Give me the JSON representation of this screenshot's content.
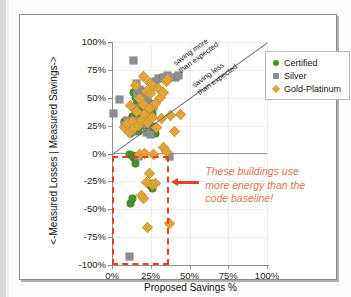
{
  "chart_data": {
    "type": "scatter",
    "title": "",
    "xlabel": "Proposed Savings %",
    "ylabel": "<-Measured Losses | Measured Savings->",
    "xlim": [
      0,
      100
    ],
    "ylim": [
      -100,
      100
    ],
    "xticks": [
      "0%",
      "25%",
      "50%",
      "75%",
      "100%"
    ],
    "xtick_values": [
      0,
      25,
      50,
      75,
      100
    ],
    "yticks": [
      "100%",
      "75%",
      "50%",
      "25%",
      "0%",
      "-25%",
      "-50%",
      "-75%",
      "-100%"
    ],
    "ytick_values": [
      100,
      75,
      50,
      25,
      0,
      -25,
      -50,
      -75,
      -100
    ],
    "grid": true,
    "legend_position": "top-right",
    "legend": [
      "Certified",
      "Silver",
      "Gold-Platinum"
    ],
    "colors": {
      "certified": "#4a9028",
      "silver": "#8a8f91",
      "gold": "#e0a53a",
      "highlight": "#e8401f",
      "annotation": "#e2724a",
      "parity_line": "#6b6b6b"
    },
    "reference_line": {
      "label_above": "saving more than expected",
      "label_below": "saving less than expected",
      "from": [
        0,
        0
      ],
      "to": [
        100,
        100
      ]
    },
    "annotations": [
      {
        "text": "These buildings use more energy than the code baseline!",
        "lines": [
          "These buildings use",
          "more energy than the",
          "code baseline!"
        ],
        "color": "#e2724a"
      }
    ],
    "highlight_region": {
      "x_range": [
        0,
        37
      ],
      "y_range": [
        -100,
        -2
      ],
      "style": "red dashed rectangle"
    },
    "series": [
      {
        "name": "Certified",
        "marker": "circle",
        "color": "#4a9028",
        "points": [
          [
            8,
            29
          ],
          [
            9,
            24
          ],
          [
            10,
            21
          ],
          [
            11,
            26
          ],
          [
            12,
            18
          ],
          [
            13,
            33
          ],
          [
            13,
            22
          ],
          [
            14,
            55
          ],
          [
            14,
            27
          ],
          [
            15,
            50
          ],
          [
            15,
            37
          ],
          [
            15,
            25
          ],
          [
            16,
            58
          ],
          [
            16,
            44
          ],
          [
            16,
            29
          ],
          [
            17,
            52
          ],
          [
            17,
            35
          ],
          [
            17,
            20
          ],
          [
            18,
            47
          ],
          [
            18,
            25
          ],
          [
            19,
            41
          ],
          [
            19,
            30
          ],
          [
            20,
            56
          ],
          [
            20,
            34
          ],
          [
            21,
            25
          ],
          [
            22,
            38
          ],
          [
            23,
            31
          ],
          [
            24,
            19
          ],
          [
            25,
            45
          ],
          [
            26,
            36
          ],
          [
            27,
            24
          ],
          [
            28,
            18
          ],
          [
            11,
            -1
          ],
          [
            13,
            -2
          ],
          [
            14,
            -4
          ],
          [
            15,
            -9
          ],
          [
            16,
            -3
          ],
          [
            12,
            -45
          ],
          [
            13,
            -40
          ],
          [
            24,
            -27
          ],
          [
            25,
            -29
          ],
          [
            26,
            -31
          ]
        ]
      },
      {
        "name": "Silver",
        "marker": "square",
        "color": "#8a8f91",
        "points": [
          [
            1,
            36
          ],
          [
            5,
            48
          ],
          [
            8,
            26
          ],
          [
            10,
            30
          ],
          [
            13,
            20
          ],
          [
            14,
            83
          ],
          [
            15,
            41
          ],
          [
            16,
            63
          ],
          [
            16,
            53
          ],
          [
            17,
            30
          ],
          [
            18,
            57
          ],
          [
            19,
            45
          ],
          [
            20,
            52
          ],
          [
            21,
            26
          ],
          [
            22,
            19
          ],
          [
            23,
            48
          ],
          [
            24,
            33
          ],
          [
            25,
            17
          ],
          [
            27,
            42
          ],
          [
            28,
            65
          ],
          [
            30,
            67
          ],
          [
            33,
            68
          ],
          [
            36,
            70
          ],
          [
            41,
            68
          ],
          [
            43,
            70
          ],
          [
            17,
            -3
          ],
          [
            37,
            -3
          ],
          [
            11,
            -92
          ]
        ]
      },
      {
        "name": "Gold-Platinum",
        "marker": "diamond",
        "color": "#e0a53a",
        "points": [
          [
            8,
            23
          ],
          [
            10,
            27
          ],
          [
            11,
            19
          ],
          [
            12,
            43
          ],
          [
            13,
            29
          ],
          [
            14,
            22
          ],
          [
            15,
            61
          ],
          [
            16,
            38
          ],
          [
            17,
            25
          ],
          [
            18,
            49
          ],
          [
            19,
            30
          ],
          [
            20,
            69
          ],
          [
            20,
            44
          ],
          [
            21,
            35
          ],
          [
            22,
            56
          ],
          [
            23,
            28
          ],
          [
            24,
            64
          ],
          [
            24,
            40
          ],
          [
            25,
            54
          ],
          [
            26,
            32
          ],
          [
            27,
            60
          ],
          [
            28,
            45
          ],
          [
            29,
            23
          ],
          [
            30,
            58
          ],
          [
            31,
            50
          ],
          [
            32,
            31
          ],
          [
            33,
            55
          ],
          [
            35,
            65
          ],
          [
            36,
            66
          ],
          [
            38,
            34
          ],
          [
            40,
            20
          ],
          [
            44,
            35
          ],
          [
            18,
            -1
          ],
          [
            21,
            0
          ],
          [
            27,
            -1
          ],
          [
            33,
            5
          ],
          [
            35,
            2
          ],
          [
            24,
            -18
          ],
          [
            22,
            -26
          ],
          [
            26,
            -28
          ],
          [
            28,
            -27
          ],
          [
            19,
            -38
          ],
          [
            20,
            -40
          ],
          [
            23,
            -66
          ],
          [
            37,
            -63
          ]
        ]
      }
    ]
  }
}
